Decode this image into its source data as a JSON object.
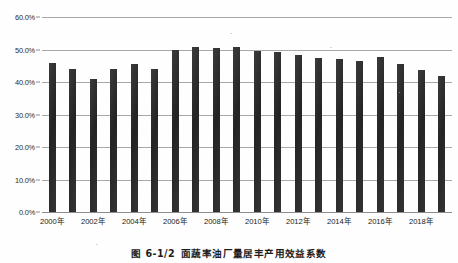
{
  "figure": {
    "caption_number": "图 6-1/2",
    "caption_text": "面蔬率油厂量居丰产用效益系数",
    "caption_full": "图 6-1/2  面蔬率油厂量居丰产用效益系数"
  },
  "chart_data": {
    "type": "bar",
    "title": "",
    "xlabel": "",
    "ylabel": "",
    "ylim": [
      0,
      60
    ],
    "ytick_labels": [
      "0.0%",
      "10.0%",
      "20.0%",
      "30.0%",
      "40.0%",
      "50.0%",
      "60.0%"
    ],
    "ytick_values": [
      0,
      10,
      20,
      30,
      40,
      50,
      60
    ],
    "grid": true,
    "legend": "none",
    "categories": [
      "2000年",
      "2001年",
      "2002年",
      "2003年",
      "2004年",
      "2005年",
      "2006年",
      "2007年",
      "2008年",
      "2009年",
      "2010年",
      "2011年",
      "2012年",
      "2013年",
      "2014年",
      "2015年",
      "2016年",
      "2017年",
      "2018年",
      "2019年"
    ],
    "xtick_labels_shown": [
      "2000年",
      "2002年",
      "2004年",
      "2006年",
      "2008年",
      "2010年",
      "2012年",
      "2014年",
      "2016年",
      "2018年"
    ],
    "values": [
      46.0,
      44.0,
      41.0,
      44.0,
      45.5,
      44.0,
      49.8,
      50.8,
      50.5,
      50.7,
      49.5,
      49.3,
      48.2,
      47.5,
      47.0,
      46.6,
      47.7,
      45.5,
      43.8,
      41.8
    ],
    "bar_color": "#2e2e2e",
    "gridline_color": "#a9a9a9",
    "units": "percent"
  }
}
